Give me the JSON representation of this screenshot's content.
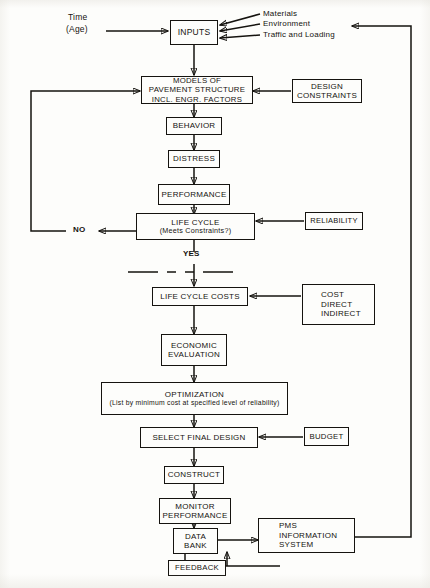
{
  "diagram": {
    "ink_color": "#15130f",
    "paper_color": "#fdfdfb"
  },
  "inputs": {
    "time_line1": "Time",
    "time_line2": "(Age)",
    "box_label": "INPUTS",
    "feeds": [
      "Materials",
      "Environment",
      "Traffic and Loading"
    ]
  },
  "nodes": {
    "models": {
      "line1": "MODELS OF",
      "line2": "PAVEMENT STRUCTURE",
      "line3": "INCL. ENGR. FACTORS"
    },
    "design_constraints": {
      "line1": "DESIGN",
      "line2": "CONSTRAINTS"
    },
    "behavior": {
      "line1": "BEHAVIOR"
    },
    "distress": {
      "line1": "DISTRESS"
    },
    "performance": {
      "line1": "PERFORMANCE"
    },
    "life_cycle": {
      "line1": "LIFE CYCLE",
      "line2": "(Meets Constraints?)"
    },
    "reliability": {
      "line1": "RELIABILITY"
    },
    "life_cycle_costs": {
      "line1": "LIFE CYCLE COSTS"
    },
    "cost": {
      "line1": "COST",
      "line2": "DIRECT",
      "line3": "INDIRECT"
    },
    "economic_evaluation": {
      "line1": "ECONOMIC",
      "line2": "EVALUATION"
    },
    "optimization": {
      "line1": "OPTIMIZATION",
      "line2": "(List by minimum cost at specified level of reliability)"
    },
    "select_final_design": {
      "line1": "SELECT FINAL DESIGN"
    },
    "budget": {
      "line1": "BUDGET"
    },
    "construct": {
      "line1": "CONSTRUCT"
    },
    "monitor_performance": {
      "line1": "MONITOR",
      "line2": "PERFORMANCE"
    },
    "data_bank": {
      "line1": "DATA",
      "line2": "BANK"
    },
    "pms_information_system": {
      "line1": "PMS",
      "line2": "INFORMATION",
      "line3": "SYSTEM"
    },
    "feedback": {
      "line1": "FEEDBACK"
    }
  },
  "decision_labels": {
    "no": "NO",
    "yes": "YES"
  }
}
